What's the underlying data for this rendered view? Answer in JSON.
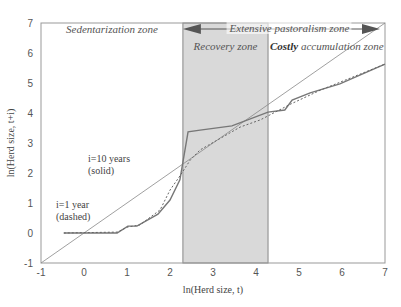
{
  "chart_data": {
    "type": "line",
    "title": "",
    "xlabel": "ln(Herd size, t)",
    "ylabel": "ln(Herd size, t+i)",
    "xlim": [
      -1,
      7
    ],
    "ylim": [
      -1,
      7
    ],
    "x_ticks": [
      "-1",
      "0",
      "1",
      "2",
      "3",
      "4",
      "5",
      "6",
      "7"
    ],
    "y_ticks": [
      "-1",
      "0",
      "1",
      "2",
      "3",
      "4",
      "5",
      "6",
      "7"
    ],
    "grid": false,
    "shaded_region": {
      "label": "Recovery zone",
      "x_range": [
        2.3,
        4.28
      ],
      "color": "#d9d9d9"
    },
    "zones": {
      "left": "Sedentarization zone",
      "middle": "Recovery zone",
      "right_bold": "Costly",
      "right_rest": " accumulation zone",
      "top_arrow": "Extensive pastoralism zone"
    },
    "annotations": {
      "solid_label_1": "i=10 years",
      "solid_label_2": "(solid)",
      "dashed_label_1": "i=1 year",
      "dashed_label_2": "(dashed)"
    },
    "series": [
      {
        "name": "45-degree line",
        "style": "thin",
        "x": [
          -1,
          7
        ],
        "y": [
          -1,
          7
        ]
      },
      {
        "name": "i=10 years (solid)",
        "style": "solid",
        "x": [
          -0.47,
          0.77,
          1.02,
          1.23,
          1.72,
          2.0,
          2.23,
          2.42,
          2.7,
          3.44,
          4.28,
          4.67,
          4.84,
          5.26,
          5.95,
          7.0
        ],
        "y": [
          0.0,
          0.0,
          0.23,
          0.23,
          0.63,
          1.1,
          1.77,
          3.37,
          3.43,
          3.57,
          4.03,
          4.1,
          4.43,
          4.67,
          4.97,
          5.63
        ]
      },
      {
        "name": "i=1 year (dashed)",
        "style": "dashed",
        "x": [
          -0.47,
          0.77,
          1.02,
          1.3,
          1.77,
          2.0,
          2.23,
          2.47,
          2.7,
          3.63,
          4.1,
          4.81,
          5.51,
          7.0
        ],
        "y": [
          0.0,
          0.03,
          0.2,
          0.27,
          0.77,
          1.43,
          1.9,
          2.43,
          2.77,
          3.53,
          3.77,
          4.3,
          4.77,
          5.63
        ]
      }
    ]
  }
}
